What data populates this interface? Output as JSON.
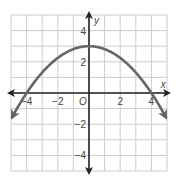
{
  "chart_data": {
    "type": "line",
    "title": "",
    "xlabel": "x",
    "ylabel": "y",
    "origin_label": "O",
    "xlim": [
      -5,
      5
    ],
    "ylim": [
      -5,
      5
    ],
    "grid": true,
    "x_ticks": [
      {
        "value": -4,
        "label": "−4"
      },
      {
        "value": -2,
        "label": "−2"
      },
      {
        "value": 2,
        "label": "2"
      },
      {
        "value": 4,
        "label": "4"
      }
    ],
    "y_ticks": [
      {
        "value": 4,
        "label": "4"
      },
      {
        "value": 2,
        "label": "2"
      },
      {
        "value": -2,
        "label": "−2"
      },
      {
        "value": -4,
        "label": "−4"
      }
    ],
    "series": [
      {
        "name": "parabola",
        "equation": "y = -3/16 x^2 + 3",
        "vertex": [
          0,
          3
        ],
        "x_intercepts": [
          -4,
          4
        ],
        "x": [
          -5,
          -4,
          -3,
          -2,
          -1,
          0,
          1,
          2,
          3,
          4,
          5
        ],
        "values": [
          -1.69,
          0,
          1.31,
          2.25,
          2.81,
          3,
          2.81,
          2.25,
          1.31,
          0,
          -1.69
        ],
        "arrows_at_ends": true
      }
    ],
    "colors": {
      "curve": "#666666",
      "axis": "#222222",
      "grid": "#cccccc"
    }
  }
}
